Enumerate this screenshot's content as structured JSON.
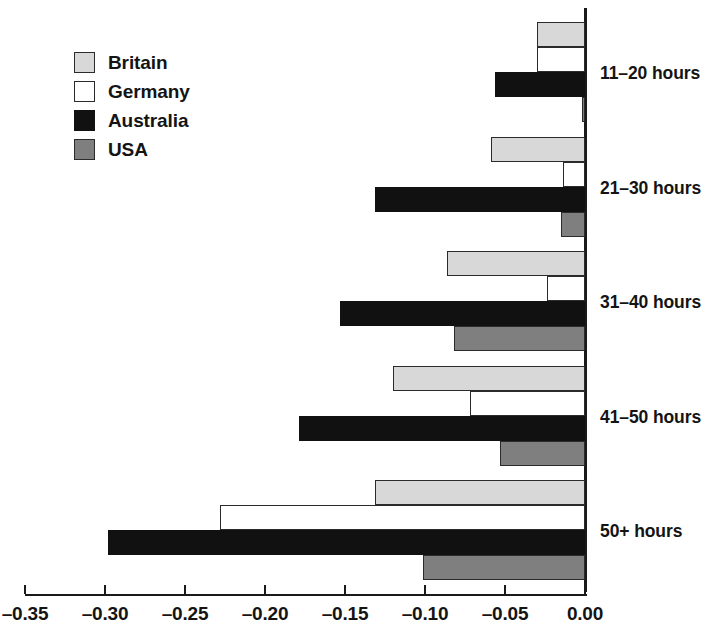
{
  "chart_data": {
    "type": "bar",
    "orientation": "horizontal",
    "title": "",
    "subtitle": "",
    "xlabel": "",
    "ylabel": "",
    "xlim": [
      -0.35,
      0.0
    ],
    "xticks": [
      -0.35,
      -0.3,
      -0.25,
      -0.2,
      -0.15,
      -0.1,
      -0.05,
      0.0
    ],
    "xticklabels": [
      "–0.35",
      "–0.30",
      "–0.25",
      "–0.20",
      "–0.15",
      "–0.10",
      "–0.05",
      "0.00"
    ],
    "grid": false,
    "legend_position": "upper-left",
    "categories": [
      "11–20 hours",
      "21–30 hours",
      "31–40 hours",
      "41–50 hours",
      "50+ hours"
    ],
    "series": [
      {
        "name": "Britain",
        "color": "#d8d8d8",
        "values": [
          -0.03,
          -0.059,
          -0.086,
          -0.12,
          -0.131
        ]
      },
      {
        "name": "Germany",
        "color": "#ffffff",
        "values": [
          -0.03,
          -0.014,
          -0.024,
          -0.072,
          -0.228
        ]
      },
      {
        "name": "Australia",
        "color": "#111111",
        "values": [
          -0.056,
          -0.131,
          -0.153,
          -0.179,
          -0.298
        ]
      },
      {
        "name": "USA",
        "color": "#7f7f7f",
        "values": [
          -0.002,
          -0.015,
          -0.082,
          -0.053,
          -0.101
        ]
      }
    ]
  },
  "legend": {
    "items": [
      {
        "label": "Britain",
        "swatch": "britain"
      },
      {
        "label": "Germany",
        "swatch": "germany"
      },
      {
        "label": "Australia",
        "swatch": "australia"
      },
      {
        "label": "USA",
        "swatch": "usa"
      }
    ]
  },
  "colors": {
    "britain": "#d8d8d8",
    "germany": "#ffffff",
    "australia": "#111111",
    "usa": "#7f7f7f",
    "axis": "#1a1a1a",
    "text": "#141414",
    "background": "#ffffff"
  }
}
